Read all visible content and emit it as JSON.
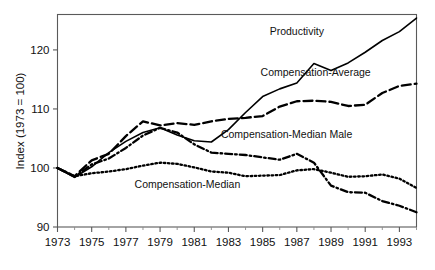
{
  "chart_data": {
    "type": "line",
    "title": "",
    "xlabel": "",
    "ylabel": "Index (1973 = 100)",
    "xlim": [
      1973,
      1994
    ],
    "ylim": [
      90,
      126
    ],
    "grid": false,
    "legend_position": "inline-annotations",
    "y_ticks": [
      "90",
      "100",
      "110",
      "120"
    ],
    "y_tick_values": [
      90,
      100,
      110,
      120
    ],
    "x_ticks": [
      "1973",
      "1975",
      "1977",
      "1979",
      "1981",
      "1983",
      "1985",
      "1987",
      "1989",
      "1991",
      "1993"
    ],
    "x_tick_values": [
      1973,
      1975,
      1977,
      1979,
      1981,
      1983,
      1985,
      1987,
      1989,
      1991,
      1993
    ],
    "x": [
      1973,
      1974,
      1975,
      1976,
      1977,
      1978,
      1979,
      1980,
      1981,
      1982,
      1983,
      1984,
      1985,
      1986,
      1987,
      1988,
      1989,
      1990,
      1991,
      1992,
      1993,
      1994
    ],
    "series": [
      {
        "name": "Productivity",
        "style": "solid",
        "color": "#000000",
        "label_x": 1987.0,
        "label_y": 122.6,
        "values": [
          100.0,
          98.4,
          100.2,
          102.6,
          104.5,
          106.0,
          106.8,
          105.6,
          104.6,
          104.4,
          106.5,
          109.4,
          112.1,
          113.4,
          114.4,
          117.7,
          116.5,
          117.8,
          119.6,
          121.6,
          123.1,
          125.4
        ]
      },
      {
        "name": "Compensation-Average",
        "style": "dashed",
        "color": "#000000",
        "label_x": 1988.1,
        "label_y": 115.6,
        "values": [
          100.0,
          98.6,
          101.3,
          102.4,
          105.4,
          107.9,
          107.2,
          107.6,
          107.3,
          107.9,
          108.3,
          108.5,
          108.8,
          110.4,
          111.3,
          111.4,
          111.2,
          110.5,
          110.7,
          112.7,
          113.9,
          114.3
        ]
      },
      {
        "name": "Compensation-Median Male",
        "style": "dashdot",
        "color": "#000000",
        "label_x": 1986.4,
        "label_y": 105.1,
        "values": [
          100.0,
          98.5,
          100.6,
          101.6,
          103.4,
          105.5,
          106.8,
          106.0,
          104.0,
          102.6,
          102.4,
          102.2,
          101.8,
          101.4,
          102.4,
          100.9,
          97.0,
          95.9,
          95.8,
          94.4,
          93.6,
          92.5
        ]
      },
      {
        "name": "Compensation-Median",
        "style": "dotted",
        "color": "#000000",
        "label_x": 1980.6,
        "label_y": 96.6,
        "values": [
          100.0,
          98.6,
          99.1,
          99.4,
          99.8,
          100.4,
          100.9,
          100.7,
          100.1,
          99.4,
          99.2,
          98.6,
          98.7,
          98.8,
          99.6,
          99.8,
          99.2,
          98.5,
          98.6,
          98.9,
          98.2,
          96.6
        ]
      }
    ]
  },
  "axis": {
    "y_title": "Index (1973 = 100)"
  }
}
